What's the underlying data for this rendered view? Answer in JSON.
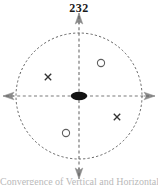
{
  "figure": {
    "number_label": "232",
    "caption_partial": "Convergence of Vertical and Horizontal",
    "background_color": "#ffffff",
    "ink_color": "#3a3a3a",
    "label_color": "#1a1a1a"
  },
  "diagram": {
    "type": "circular-axis-diagram",
    "boundary": {
      "name": "dashed-circle",
      "shape": "circle",
      "center_x": 79,
      "center_y": 96,
      "radius": 63,
      "stroke": "#4a4a4a",
      "stroke_width": 1,
      "dash": "2,2",
      "fill": "none"
    },
    "axes": [
      {
        "name": "vertical-axis",
        "orientation": "vertical",
        "x1": 79,
        "y1": 14,
        "x2": 79,
        "y2": 178,
        "stroke": "#555555",
        "dash": "3,2.5",
        "arrow_start": "up",
        "arrow_end": "down"
      },
      {
        "name": "horizontal-axis",
        "orientation": "horizontal",
        "x1": 4,
        "y1": 96,
        "x2": 154,
        "y2": 96,
        "stroke": "#555555",
        "dash": "3,2.5",
        "arrow_start": "left",
        "arrow_end": "right"
      }
    ],
    "center_marker": {
      "name": "center-ellipse",
      "shape": "filled-ellipse",
      "cx": 79,
      "cy": 96,
      "rx": 8,
      "ry": 4,
      "fill": "#111111"
    },
    "markers": [
      {
        "name": "circle-marker-upper-right",
        "glyph": "circle",
        "quadrant": "upper-right",
        "cx": 101,
        "cy": 63,
        "r": 3.6,
        "stroke": "#555555",
        "fill": "none"
      },
      {
        "name": "cross-marker-upper-left",
        "glyph": "cross",
        "quadrant": "upper-left",
        "cx": 48,
        "cy": 77,
        "size": 3.4,
        "stroke": "#333333"
      },
      {
        "name": "cross-marker-lower-right",
        "glyph": "cross",
        "quadrant": "lower-right",
        "cx": 117,
        "cy": 117,
        "size": 3.4,
        "stroke": "#333333"
      },
      {
        "name": "circle-marker-lower-left",
        "glyph": "circle",
        "quadrant": "lower-left",
        "cx": 66,
        "cy": 133,
        "r": 3.6,
        "stroke": "#555555",
        "fill": "none"
      }
    ],
    "arrowheads": [
      {
        "name": "arrowhead-top",
        "direction": "up",
        "x": 79,
        "y": 14
      },
      {
        "name": "arrowhead-bottom",
        "direction": "down",
        "x": 79,
        "y": 178
      },
      {
        "name": "arrowhead-left",
        "direction": "left",
        "x": 4,
        "y": 96
      },
      {
        "name": "arrowhead-right",
        "direction": "right",
        "x": 154,
        "y": 96
      }
    ]
  }
}
